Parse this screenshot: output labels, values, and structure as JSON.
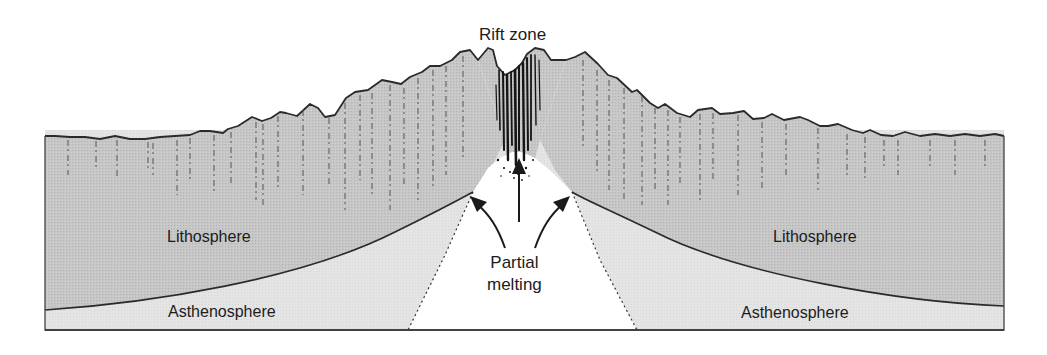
{
  "figure": {
    "labels": {
      "rift_zone": "Rift zone",
      "lithosphere_left": "Lithosphere",
      "lithosphere_right": "Lithosphere",
      "asthenosphere_left": "Asthenosphere",
      "asthenosphere_right": "Asthenosphere",
      "partial_melting_line1": "Partial",
      "partial_melting_line2": "melting"
    },
    "colors": {
      "lithosphere": "#c4c4c4",
      "asthenosphere": "#e2e2e2",
      "melt_zone": "#ffffff",
      "outline": "#2a2a2a",
      "rift_fractures": "#151515"
    },
    "arrows": [
      {
        "name": "upwelling-arrow",
        "direction": "up"
      },
      {
        "name": "partial-melting-arrow-left",
        "direction": "up-left"
      },
      {
        "name": "partial-melting-arrow-right",
        "direction": "up-right"
      }
    ]
  }
}
